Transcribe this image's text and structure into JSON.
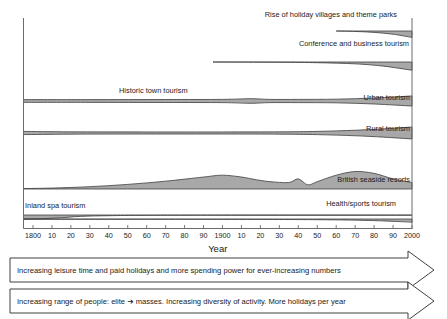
{
  "figure": {
    "background": "#ffffff",
    "band_fill": "#a8a8a8",
    "band_stroke": "#3d3d3d",
    "axis_color": "#6b6b6b",
    "text_color": "#1a1a1a"
  },
  "axis": {
    "title": "Year",
    "x_start": 1795,
    "x_end": 2000,
    "tick_labels": [
      "1800",
      "10",
      "20",
      "30",
      "40",
      "50",
      "60",
      "70",
      "80",
      "90",
      "1900",
      "10",
      "20",
      "30",
      "40",
      "50",
      "60",
      "70",
      "80",
      "90",
      "2000"
    ],
    "tick_years": [
      1800,
      1810,
      1820,
      1830,
      1840,
      1850,
      1860,
      1870,
      1880,
      1890,
      1900,
      1910,
      1920,
      1930,
      1940,
      1950,
      1960,
      1970,
      1980,
      1990,
      2000
    ],
    "grid": false
  },
  "chart_data": {
    "type": "area",
    "title": "",
    "subtitle": "",
    "xlabel": "Year",
    "ylabel": "",
    "xlim": [
      1795,
      2000
    ],
    "legend_position": "inline-labels",
    "note": "Stream/flow diagram: band thickness represents relative volume of each form of tourism over time.",
    "series": [
      {
        "name": "Rise of holiday villages and theme parks",
        "label": "Rise of holiday villages and theme parks",
        "label_year": 1925,
        "start_year": 1960,
        "x": [
          1960,
          1970,
          1980,
          1990,
          2000
        ],
        "values": [
          0,
          1,
          3,
          7,
          14
        ]
      },
      {
        "name": "Conference and business tourism",
        "label": "Conference and business tourism",
        "label_year": 1932,
        "start_year": 1895,
        "x": [
          1895,
          1930,
          1950,
          1970,
          1985,
          2000
        ],
        "values": [
          0,
          0.5,
          1.5,
          4,
          9,
          18
        ]
      },
      {
        "name": "Historic town tourism / Urban tourism",
        "label": "Historic town tourism",
        "label2": "Urban tourism",
        "label_year": 1840,
        "label2_year": 1975,
        "start_year": 1795,
        "x": [
          1795,
          1830,
          1870,
          1900,
          1915,
          1925,
          1940,
          1960,
          1980,
          2000
        ],
        "values": [
          6,
          6,
          6.5,
          7,
          10,
          7,
          7,
          8,
          13,
          22
        ]
      },
      {
        "name": "Rural tourism",
        "label": "Rural tourism",
        "label_year": 1975,
        "start_year": 1795,
        "x": [
          1795,
          1820,
          1860,
          1900,
          1930,
          1950,
          1970,
          1985,
          2000
        ],
        "values": [
          7,
          5,
          4.5,
          4.5,
          5,
          7,
          12,
          18,
          26
        ]
      },
      {
        "name": "British seaside resorts",
        "label": "British seaside resorts",
        "label_year": 1958,
        "start_year": 1795,
        "x": [
          1795,
          1810,
          1830,
          1850,
          1870,
          1890,
          1900,
          1910,
          1918,
          1925,
          1935,
          1940,
          1945,
          1950,
          1960,
          1970,
          1980,
          1990,
          2000
        ],
        "values": [
          1,
          2,
          5,
          10,
          17,
          26,
          30,
          26,
          20,
          16,
          14,
          22,
          9,
          16,
          30,
          38,
          34,
          22,
          14
        ]
      },
      {
        "name": "Inland spa tourism",
        "label": "Inland spa tourism",
        "label_year": 1801,
        "start_year": 1795,
        "x": [
          1795,
          1805,
          1815,
          1825,
          1840,
          1860,
          1900,
          2000
        ],
        "values": [
          9,
          8,
          6,
          3,
          1.5,
          0.8,
          0.5,
          0.5
        ]
      },
      {
        "name": "Health/sports tourism",
        "label": "Health/sports tourism",
        "label_year": 1950,
        "start_year": 1795,
        "x": [
          1795,
          1900,
          1950,
          1975,
          1990,
          2000
        ],
        "values": [
          0.5,
          0.8,
          1.5,
          3,
          5,
          7
        ]
      }
    ]
  },
  "banners": [
    {
      "id": "banner-leisure-time",
      "text": "Increasing leisure time and paid holidays and more spending power for ever-increasing numbers"
    },
    {
      "id": "banner-range-of-people",
      "text": "Increasing range of people: elite ➔ masses. Increasing diversity of activity. More holidays per year"
    }
  ]
}
